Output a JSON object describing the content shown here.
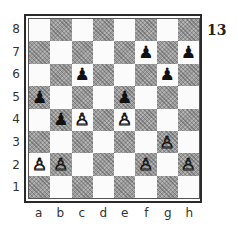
{
  "diagram": {
    "number": "13",
    "files": [
      "a",
      "b",
      "c",
      "d",
      "e",
      "f",
      "g",
      "h"
    ],
    "ranks": [
      "8",
      "7",
      "6",
      "5",
      "4",
      "3",
      "2",
      "1"
    ],
    "colors": {
      "light_square": "#fbfbfb",
      "dark_square": "#9a9a9a",
      "frame": "#2a2a2a"
    },
    "pieces": [
      {
        "square": "f7",
        "color": "black",
        "type": "pawn",
        "glyph": "♟"
      },
      {
        "square": "h7",
        "color": "black",
        "type": "pawn",
        "glyph": "♟"
      },
      {
        "square": "c6",
        "color": "black",
        "type": "pawn",
        "glyph": "♟"
      },
      {
        "square": "g6",
        "color": "black",
        "type": "pawn",
        "glyph": "♟"
      },
      {
        "square": "a5",
        "color": "black",
        "type": "pawn",
        "glyph": "♟"
      },
      {
        "square": "e5",
        "color": "black",
        "type": "pawn",
        "glyph": "♟"
      },
      {
        "square": "b4",
        "color": "black",
        "type": "pawn",
        "glyph": "♟"
      },
      {
        "square": "c4",
        "color": "white",
        "type": "pawn",
        "glyph": "♙"
      },
      {
        "square": "e4",
        "color": "white",
        "type": "pawn",
        "glyph": "♙"
      },
      {
        "square": "g3",
        "color": "white",
        "type": "pawn",
        "glyph": "♙"
      },
      {
        "square": "a2",
        "color": "white",
        "type": "pawn",
        "glyph": "♙"
      },
      {
        "square": "b2",
        "color": "white",
        "type": "pawn",
        "glyph": "♙"
      },
      {
        "square": "f2",
        "color": "white",
        "type": "pawn",
        "glyph": "♙"
      },
      {
        "square": "h2",
        "color": "white",
        "type": "pawn",
        "glyph": "♙"
      }
    ]
  }
}
